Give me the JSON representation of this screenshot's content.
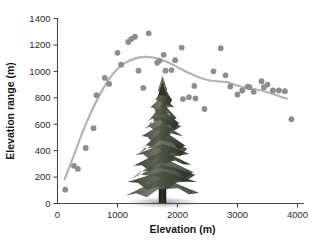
{
  "chart_data": {
    "type": "scatter",
    "title": "",
    "xlabel": "Elevation (m)",
    "ylabel": "Elevation range (m)",
    "xlim": [
      0,
      4100
    ],
    "ylim": [
      0,
      1400
    ],
    "xticks": [
      0,
      1000,
      2000,
      3000,
      4000
    ],
    "yticks": [
      0,
      200,
      400,
      600,
      800,
      1000,
      1200,
      1400
    ],
    "xtick_labels": [
      "0",
      "1000",
      "2000",
      "3000",
      "4000"
    ],
    "ytick_labels": [
      "0",
      "200",
      "400",
      "600",
      "800",
      "1000",
      "1200",
      "1400"
    ],
    "grid": false,
    "legend": "none",
    "point_color": "#8d8d8d",
    "curve_color": "#b3b3b3",
    "axis_color": "#4a4a4a",
    "background": "#ffffff",
    "series": [
      {
        "name": "Elevation range vs elevation",
        "marker": "circle",
        "points": [
          {
            "x": 130,
            "y": 105
          },
          {
            "x": 275,
            "y": 285
          },
          {
            "x": 340,
            "y": 262
          },
          {
            "x": 470,
            "y": 420
          },
          {
            "x": 600,
            "y": 570
          },
          {
            "x": 650,
            "y": 820
          },
          {
            "x": 790,
            "y": 950
          },
          {
            "x": 860,
            "y": 905
          },
          {
            "x": 1000,
            "y": 1140
          },
          {
            "x": 1060,
            "y": 1050
          },
          {
            "x": 1180,
            "y": 1222
          },
          {
            "x": 1230,
            "y": 1245
          },
          {
            "x": 1290,
            "y": 1262
          },
          {
            "x": 1350,
            "y": 1005
          },
          {
            "x": 1430,
            "y": 875
          },
          {
            "x": 1520,
            "y": 1288
          },
          {
            "x": 1660,
            "y": 1065
          },
          {
            "x": 1700,
            "y": 1080
          },
          {
            "x": 1770,
            "y": 1125
          },
          {
            "x": 1800,
            "y": 1005
          },
          {
            "x": 1900,
            "y": 1010
          },
          {
            "x": 1960,
            "y": 1085
          },
          {
            "x": 2070,
            "y": 1180
          },
          {
            "x": 2090,
            "y": 790
          },
          {
            "x": 2190,
            "y": 805
          },
          {
            "x": 2280,
            "y": 890
          },
          {
            "x": 2300,
            "y": 795
          },
          {
            "x": 2450,
            "y": 715
          },
          {
            "x": 2600,
            "y": 1000
          },
          {
            "x": 2720,
            "y": 1175
          },
          {
            "x": 2800,
            "y": 970
          },
          {
            "x": 2880,
            "y": 885
          },
          {
            "x": 3000,
            "y": 825
          },
          {
            "x": 3080,
            "y": 855
          },
          {
            "x": 3170,
            "y": 885
          },
          {
            "x": 3200,
            "y": 880
          },
          {
            "x": 3270,
            "y": 845
          },
          {
            "x": 3400,
            "y": 925
          },
          {
            "x": 3440,
            "y": 880
          },
          {
            "x": 3500,
            "y": 900
          },
          {
            "x": 3590,
            "y": 855
          },
          {
            "x": 3690,
            "y": 855
          },
          {
            "x": 3790,
            "y": 850
          },
          {
            "x": 3900,
            "y": 638
          }
        ]
      }
    ],
    "trend_curve": {
      "name": "loess smoother",
      "points": [
        {
          "x": 120,
          "y": 185
        },
        {
          "x": 250,
          "y": 335
        },
        {
          "x": 400,
          "y": 520
        },
        {
          "x": 550,
          "y": 680
        },
        {
          "x": 700,
          "y": 820
        },
        {
          "x": 850,
          "y": 935
        },
        {
          "x": 1000,
          "y": 1020
        },
        {
          "x": 1150,
          "y": 1070
        },
        {
          "x": 1300,
          "y": 1098
        },
        {
          "x": 1450,
          "y": 1110
        },
        {
          "x": 1600,
          "y": 1105
        },
        {
          "x": 1750,
          "y": 1085
        },
        {
          "x": 1900,
          "y": 1055
        },
        {
          "x": 2050,
          "y": 1020
        },
        {
          "x": 2200,
          "y": 985
        },
        {
          "x": 2350,
          "y": 955
        },
        {
          "x": 2500,
          "y": 935
        },
        {
          "x": 2650,
          "y": 925
        },
        {
          "x": 2800,
          "y": 920
        },
        {
          "x": 2950,
          "y": 900
        },
        {
          "x": 3100,
          "y": 880
        },
        {
          "x": 3250,
          "y": 868
        },
        {
          "x": 3400,
          "y": 855
        },
        {
          "x": 3550,
          "y": 835
        },
        {
          "x": 3700,
          "y": 812
        },
        {
          "x": 3820,
          "y": 792
        }
      ]
    },
    "annotations": [
      {
        "type": "image-overlay",
        "name": "conifer-tree-illustration",
        "description": "Photographic cutout of a conifer (spruce/fir) tree placed over the centre of the plot",
        "x_center": 1750,
        "y_base": 0,
        "y_top": 920
      }
    ]
  }
}
